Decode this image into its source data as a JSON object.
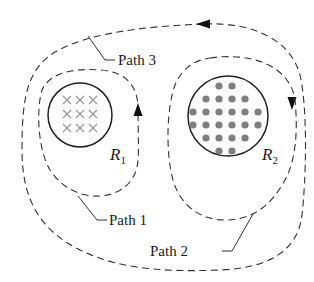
{
  "diagram": {
    "paths": [
      {
        "id": "path1",
        "label": "Path 1",
        "encloses": "R1",
        "arrow_direction": "up (counterclockwise)"
      },
      {
        "id": "path2",
        "label": "Path 2",
        "encloses": "R2",
        "arrow_direction": "none"
      },
      {
        "id": "path3",
        "label": "Path 3",
        "encloses": "R1 and R2",
        "arrow_direction": "left at top, down at right (counterclockwise)"
      }
    ],
    "regions": [
      {
        "id": "R1",
        "letter": "R",
        "subscript": "1",
        "field": "into page (crosses)",
        "pattern": "×"
      },
      {
        "id": "R2",
        "letter": "R",
        "subscript": "2",
        "field": "out of page (dots)",
        "pattern": "•"
      }
    ],
    "colors": {
      "line": "#333333",
      "circle": "#222222",
      "cross": "#9a9a9a",
      "dot": "#7f7f7f",
      "background": "#ffffff"
    }
  },
  "labels": {
    "path1": "Path 1",
    "path2": "Path 2",
    "path3": "Path 3",
    "r1_letter": "R",
    "r1_sub": "1",
    "r2_letter": "R",
    "r2_sub": "2"
  }
}
